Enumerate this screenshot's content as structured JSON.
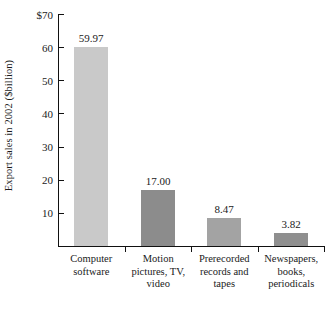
{
  "chart_data": {
    "type": "bar",
    "title": "",
    "subtitle": "",
    "xlabel": "",
    "ylabel": "Export sales in 2002 ($billion)",
    "categories": [
      "Computer software",
      "Motion pictures, TV, video",
      "Prerecorded records and tapes",
      "Newspapers, books, periodicals"
    ],
    "category_lines": [
      [
        "Computer",
        "software"
      ],
      [
        "Motion",
        "pictures, TV,",
        "video"
      ],
      [
        "Prerecorded",
        "records and",
        "tapes"
      ],
      [
        "Newspapers,",
        "books,",
        "periodicals"
      ]
    ],
    "values": [
      59.97,
      17.0,
      8.47,
      3.82
    ],
    "value_labels": [
      "59.97",
      "17.00",
      "8.47",
      "3.82"
    ],
    "bar_colors": [
      "#c9c9c9",
      "#8c8c8c",
      "#a3a3a3",
      "#8f8f8f"
    ],
    "ylim": [
      0,
      70
    ],
    "ytick_values": [
      70,
      60,
      50,
      40,
      30,
      20,
      10
    ],
    "ytick_labels": [
      "$70",
      "60",
      "50",
      "40",
      "30",
      "20",
      "10"
    ],
    "grid": false,
    "legend": false,
    "legend_position": "none",
    "axis_color": "#111111",
    "text_color": "#1a1a1a",
    "background": "#ffffff"
  }
}
